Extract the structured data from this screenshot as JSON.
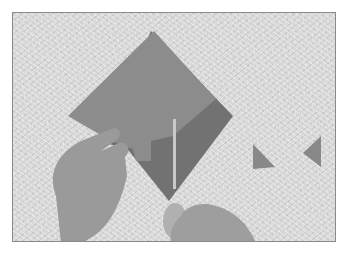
{
  "image": {
    "description": "Photograph of two hands cutting a grey square of paper with scissors on a textured white tabletop; two small cut-off triangles lie to the right.",
    "colors": {
      "background": "#ffffff",
      "tabletop": "#d8d8d8",
      "paper": "#8c8c8c",
      "paper_shadow": "#6e6e6e",
      "skin": "#9a9a9a",
      "border": "#8a8a8a"
    }
  }
}
